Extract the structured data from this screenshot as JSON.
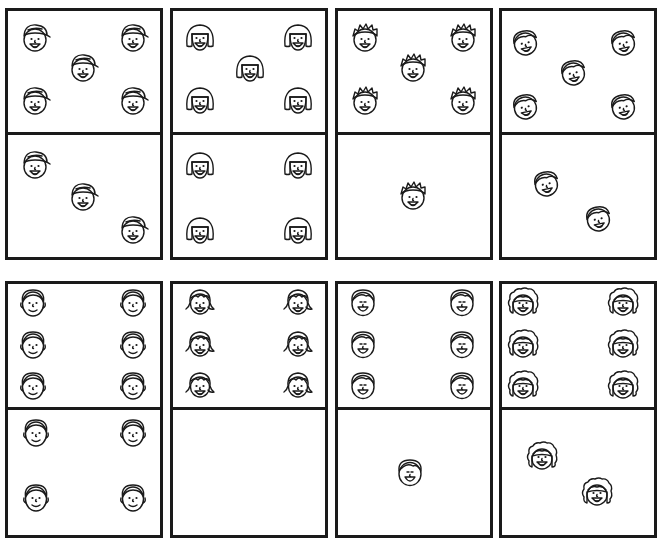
{
  "worksheet": {
    "title": "",
    "line_color": "#1a1a1a",
    "background": "#ffffff"
  },
  "dominoes": [
    {
      "id": 1,
      "face_type": "boy-cap-icon",
      "box": [
        5,
        8,
        158,
        252
      ],
      "split_y": 133,
      "top": {
        "count": 5,
        "faces": [
          [
            35,
            38
          ],
          [
            133,
            38
          ],
          [
            83,
            68
          ],
          [
            35,
            101
          ],
          [
            133,
            101
          ]
        ]
      },
      "bottom": {
        "count": 3,
        "faces": [
          [
            35,
            165
          ],
          [
            83,
            197
          ],
          [
            133,
            230
          ]
        ]
      }
    },
    {
      "id": 2,
      "face_type": "girl-bob-icon",
      "box": [
        170,
        8,
        158,
        252
      ],
      "split_y": 133,
      "top": {
        "count": 5,
        "faces": [
          [
            200,
            37
          ],
          [
            298,
            37
          ],
          [
            250,
            68
          ],
          [
            200,
            100
          ],
          [
            298,
            100
          ]
        ]
      },
      "bottom": {
        "count": 4,
        "faces": [
          [
            200,
            165
          ],
          [
            298,
            165
          ],
          [
            200,
            230
          ],
          [
            298,
            230
          ]
        ]
      }
    },
    {
      "id": 3,
      "face_type": "boy-spiky-icon",
      "box": [
        335,
        8,
        158,
        252
      ],
      "split_y": 133,
      "top": {
        "count": 5,
        "faces": [
          [
            365,
            38
          ],
          [
            463,
            38
          ],
          [
            413,
            68
          ],
          [
            365,
            101
          ],
          [
            463,
            101
          ]
        ]
      },
      "bottom": {
        "count": 1,
        "faces": [
          [
            413,
            196
          ]
        ]
      }
    },
    {
      "id": 4,
      "face_type": "boy-tilted-icon",
      "box": [
        499,
        8,
        158,
        252
      ],
      "split_y": 133,
      "top": {
        "count": 5,
        "faces": [
          [
            525,
            42
          ],
          [
            623,
            42
          ],
          [
            573,
            72
          ],
          [
            525,
            106
          ],
          [
            623,
            106
          ]
        ]
      },
      "bottom": {
        "count": 2,
        "faces": [
          [
            546,
            183
          ],
          [
            598,
            218
          ]
        ]
      }
    },
    {
      "id": 5,
      "face_type": "boy-short-hair-icon",
      "box": [
        5,
        281,
        158,
        257
      ],
      "split_y": 408,
      "top": {
        "count": 6,
        "faces": [
          [
            33,
            302
          ],
          [
            133,
            302
          ],
          [
            33,
            344
          ],
          [
            133,
            344
          ],
          [
            33,
            385
          ],
          [
            133,
            385
          ]
        ]
      },
      "bottom": {
        "count": 4,
        "faces": [
          [
            36,
            432
          ],
          [
            133,
            432
          ],
          [
            36,
            497
          ],
          [
            133,
            497
          ]
        ]
      }
    },
    {
      "id": 6,
      "face_type": "girl-flip-hair-icon",
      "box": [
        170,
        281,
        158,
        257
      ],
      "split_y": 408,
      "top": {
        "count": 6,
        "faces": [
          [
            200,
            302
          ],
          [
            298,
            302
          ],
          [
            200,
            344
          ],
          [
            298,
            344
          ],
          [
            200,
            385
          ],
          [
            298,
            385
          ]
        ]
      },
      "bottom": {
        "count": 0,
        "faces": []
      }
    },
    {
      "id": 7,
      "face_type": "boy-laughing-icon",
      "box": [
        335,
        281,
        158,
        257
      ],
      "split_y": 408,
      "top": {
        "count": 6,
        "faces": [
          [
            363,
            302
          ],
          [
            462,
            302
          ],
          [
            363,
            344
          ],
          [
            462,
            344
          ],
          [
            363,
            385
          ],
          [
            462,
            385
          ]
        ]
      },
      "bottom": {
        "count": 1,
        "faces": [
          [
            410,
            472
          ]
        ]
      }
    },
    {
      "id": 8,
      "face_type": "girl-curly-icon",
      "box": [
        499,
        281,
        158,
        257
      ],
      "split_y": 408,
      "top": {
        "count": 6,
        "faces": [
          [
            523,
            302
          ],
          [
            623,
            302
          ],
          [
            523,
            344
          ],
          [
            623,
            344
          ],
          [
            523,
            385
          ],
          [
            623,
            385
          ]
        ]
      },
      "bottom": {
        "count": 2,
        "faces": [
          [
            542,
            456
          ],
          [
            597,
            492
          ]
        ]
      }
    }
  ]
}
